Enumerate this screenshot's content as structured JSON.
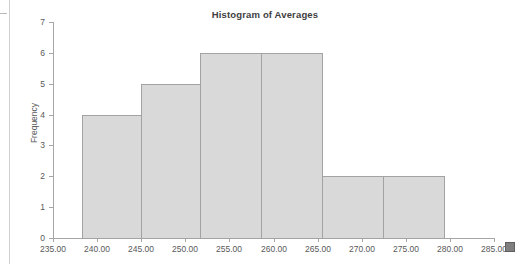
{
  "document": {
    "resize_handle": "resize-handle"
  },
  "chart_data": {
    "type": "bar",
    "title": "Histogram of Averages",
    "xlabel": "",
    "ylabel": "Frequency",
    "grid": false,
    "legend": "none",
    "xlim": [
      235.0,
      285.0
    ],
    "ylim": [
      0,
      7
    ],
    "x_tick_labels": [
      "235.00",
      "240.00",
      "245.00",
      "250.00",
      "255.00",
      "260.00",
      "265.00",
      "270.00",
      "275.00",
      "280.00",
      "285.00"
    ],
    "x_tick_values": [
      235,
      240,
      245,
      250,
      255,
      260,
      265,
      270,
      275,
      280,
      285
    ],
    "y_tick_labels": [
      "0",
      "1",
      "2",
      "3",
      "4",
      "5",
      "6",
      "7"
    ],
    "y_tick_values": [
      0,
      1,
      2,
      3,
      4,
      5,
      6,
      7
    ],
    "bin_edges": [
      238.3,
      245.0,
      251.7,
      258.6,
      265.5,
      272.4,
      279.3
    ],
    "categories": [
      "238.30-245.00",
      "245.00-251.70",
      "251.70-258.60",
      "258.60-265.50",
      "265.50-272.40",
      "272.40-279.30"
    ],
    "values": [
      4,
      5,
      6,
      6,
      2,
      2
    ],
    "bar_fill_color": "#d9d9d9",
    "bar_border_color": "#a3a3a3",
    "bars": [
      {
        "label": "bin-1",
        "value": 4,
        "x_left_px": 82,
        "x_right_px": 141
      },
      {
        "label": "bin-2",
        "value": 5,
        "x_left_px": 141,
        "x_right_px": 200
      },
      {
        "label": "bin-3",
        "value": 6,
        "x_left_px": 200,
        "x_right_px": 261
      },
      {
        "label": "bin-4",
        "value": 6,
        "x_left_px": 261,
        "x_right_px": 322
      },
      {
        "label": "bin-5",
        "value": 2,
        "x_left_px": 322,
        "x_right_px": 383
      },
      {
        "label": "bin-6",
        "value": 2,
        "x_left_px": 383,
        "x_right_px": 444
      }
    ]
  }
}
